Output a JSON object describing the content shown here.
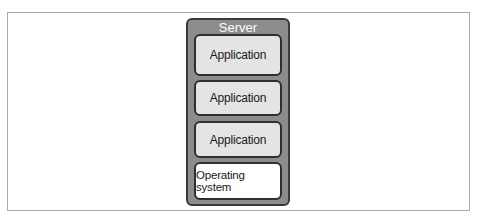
{
  "diagram": {
    "server": {
      "label": "Server"
    },
    "layers": [
      {
        "label": "Application",
        "kind": "application"
      },
      {
        "label": "Application",
        "kind": "application"
      },
      {
        "label": "Application",
        "kind": "application"
      },
      {
        "label": "Operating system",
        "kind": "os"
      }
    ],
    "colors": {
      "server_fill": "#8c8c8c",
      "server_border": "#3a3a3a",
      "application_fill": "#e4e4e4",
      "os_fill": "#ffffff",
      "frame_border": "#a9a9a9"
    }
  }
}
